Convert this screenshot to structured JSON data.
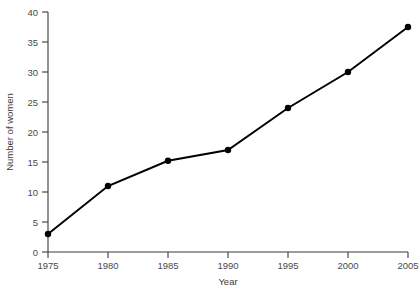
{
  "chart_data": {
    "type": "line",
    "title": "",
    "xlabel": "Year",
    "ylabel": "Number of women",
    "x": [
      1975,
      1980,
      1985,
      1990,
      1995,
      2000,
      2005
    ],
    "values": [
      3,
      11,
      15.2,
      17,
      24,
      30,
      37.5
    ],
    "categories": [
      "1975",
      "1980",
      "1985",
      "1990",
      "1995",
      "2000",
      "2005"
    ],
    "xticklabels": [
      "1975",
      "1980",
      "1985",
      "1990",
      "1995",
      "2000",
      "2005"
    ],
    "yticklabels": [
      "0",
      "5",
      "10",
      "15",
      "20",
      "25",
      "30",
      "35",
      "40"
    ],
    "yticks": [
      0,
      5,
      10,
      15,
      20,
      25,
      30,
      35,
      40
    ],
    "xlim": [
      1975,
      2005
    ],
    "ylim": [
      0,
      40
    ],
    "grid": false,
    "legend": false,
    "legend_position": "none",
    "marker": "filled-circle",
    "line_color": "#000000",
    "marker_color": "#000000",
    "axis_color": "#3a3a3a",
    "background_color": "#ffffff"
  },
  "axes": {
    "x_title": "Year",
    "y_title": "Number of women"
  }
}
